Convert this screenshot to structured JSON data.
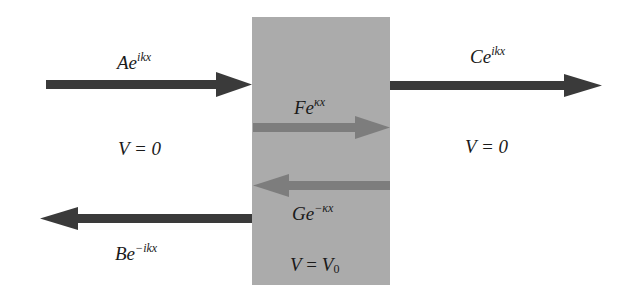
{
  "diagram": {
    "colors": {
      "background": "#ffffff",
      "barrier": "#ababab",
      "outer_arrow": "#3a3a3a",
      "inner_arrow": "#7d7d7d",
      "text": "#1a1a1a"
    },
    "barrier": {
      "x": 252,
      "y": 17,
      "width": 138,
      "height": 268,
      "label_lhs": "V",
      "label_eq": " = ",
      "label_rhs": "V",
      "label_sub": "0"
    },
    "regions": {
      "left": {
        "label": "V = 0"
      },
      "right": {
        "label": "V = 0"
      }
    },
    "waves": [
      {
        "id": "incident",
        "coef": "A",
        "base": "e",
        "exponent": "ikx",
        "direction": "right",
        "region": "left"
      },
      {
        "id": "reflected",
        "coef": "B",
        "base": "e",
        "exponent": "−ikx",
        "direction": "left",
        "region": "left"
      },
      {
        "id": "growing",
        "coef": "F",
        "base": "e",
        "exponent": "κx",
        "direction": "right",
        "region": "barrier"
      },
      {
        "id": "decaying",
        "coef": "G",
        "base": "e",
        "exponent": "−κx",
        "direction": "left",
        "region": "barrier"
      },
      {
        "id": "transmitted",
        "coef": "C",
        "base": "e",
        "exponent": "ikx",
        "direction": "right",
        "region": "right"
      }
    ]
  }
}
